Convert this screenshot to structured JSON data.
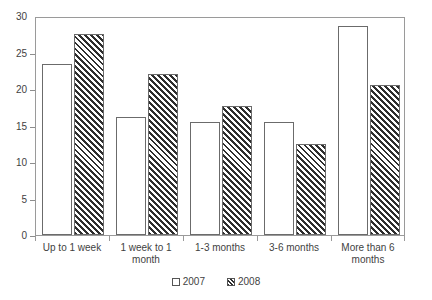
{
  "chart_data": {
    "type": "bar",
    "title": "",
    "subtitle": "",
    "xlabel": "",
    "ylabel": "",
    "ylim": [
      0,
      30
    ],
    "yticks": [
      0,
      5,
      10,
      15,
      20,
      25,
      30
    ],
    "ytick_labels": [
      "0",
      "5",
      "10",
      "15",
      "20",
      "25",
      "30"
    ],
    "grid": false,
    "legend_position": "bottom-center",
    "categories": [
      "Up to 1 week",
      "1 week to 1 month",
      "1-3 months",
      "3-6 months",
      "More than 6 months"
    ],
    "category_lines": [
      [
        "Up to 1 week"
      ],
      [
        "1 week to 1",
        "month"
      ],
      [
        "1-3 months"
      ],
      [
        "3-6 months"
      ],
      [
        "More than 6",
        "months"
      ]
    ],
    "series": [
      {
        "name": "2007",
        "fill": "solid-white",
        "values": [
          23.4,
          16.1,
          15.5,
          15.5,
          28.6
        ]
      },
      {
        "name": "2008",
        "fill": "diagonal-hatch",
        "values": [
          27.5,
          22.0,
          17.7,
          12.5,
          20.6
        ]
      }
    ]
  },
  "legend": {
    "entries": [
      {
        "label": "2007"
      },
      {
        "label": "2008"
      }
    ]
  },
  "colors": {
    "axis": "#9a9a9a",
    "text": "#3f3f3f",
    "bar_outline": "#6b6b6b",
    "hatch": "#2e2e2e",
    "background": "#ffffff"
  }
}
